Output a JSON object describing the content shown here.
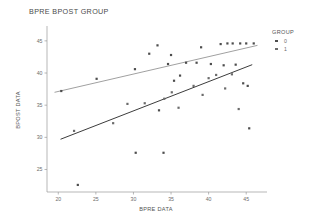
{
  "chart_data": {
    "type": "scatter",
    "title": "BPRE BPOST GROUP",
    "xlabel": "BPRE DATA",
    "ylabel": "BPOST DATA",
    "xlim": [
      18.5,
      47.5
    ],
    "ylim": [
      21.5,
      47.0
    ],
    "xticks": [
      20,
      25,
      30,
      35,
      40,
      45
    ],
    "yticks": [
      25,
      30,
      35,
      40,
      45
    ],
    "grid": false,
    "legend": {
      "title": "GROUP",
      "position": "right",
      "entries": [
        {
          "label": "0",
          "color": "#4d4d4d"
        },
        {
          "label": "1",
          "color": "#6b6b6b"
        }
      ]
    },
    "series": [
      {
        "name": "0",
        "color": "#4d4d4d",
        "points": [
          [
            20.4,
            37.2
          ],
          [
            22.6,
            22.6
          ],
          [
            25.1,
            39.1
          ],
          [
            30.2,
            40.6
          ],
          [
            30.3,
            27.6
          ],
          [
            32.1,
            43.0
          ],
          [
            33.2,
            44.3
          ],
          [
            33.4,
            34.2
          ],
          [
            34.0,
            27.6
          ],
          [
            34.6,
            41.4
          ],
          [
            35.0,
            42.8
          ],
          [
            35.4,
            38.8
          ],
          [
            36.2,
            39.6
          ],
          [
            37.0,
            41.6
          ],
          [
            38.4,
            41.6
          ],
          [
            39.0,
            44.0
          ],
          [
            40.3,
            41.4
          ],
          [
            41.6,
            44.5
          ],
          [
            42.0,
            41.2
          ],
          [
            42.5,
            44.6
          ],
          [
            43.2,
            44.6
          ],
          [
            43.6,
            41.3
          ],
          [
            44.2,
            44.6
          ],
          [
            44.6,
            38.4
          ],
          [
            45.0,
            44.6
          ],
          [
            45.2,
            38.0
          ],
          [
            45.4,
            31.4
          ],
          [
            46.0,
            44.6
          ]
        ],
        "fit": {
          "x": [
            19.5,
            46.5
          ],
          "y": [
            37.0,
            44.3
          ]
        }
      },
      {
        "name": "1",
        "color": "#6b6b6b",
        "points": [
          [
            22.1,
            31.0
          ],
          [
            27.3,
            32.2
          ],
          [
            29.2,
            35.2
          ],
          [
            31.5,
            35.3
          ],
          [
            34.1,
            36.0
          ],
          [
            35.1,
            37.0
          ],
          [
            36.0,
            34.6
          ],
          [
            38.0,
            38.0
          ],
          [
            39.2,
            36.6
          ],
          [
            40.0,
            39.2
          ],
          [
            41.0,
            39.7
          ],
          [
            42.2,
            37.6
          ],
          [
            43.1,
            39.8
          ],
          [
            44.0,
            34.4
          ]
        ],
        "fit": {
          "x": [
            20.3,
            45.8
          ],
          "y": [
            29.7,
            41.3
          ]
        }
      }
    ]
  }
}
